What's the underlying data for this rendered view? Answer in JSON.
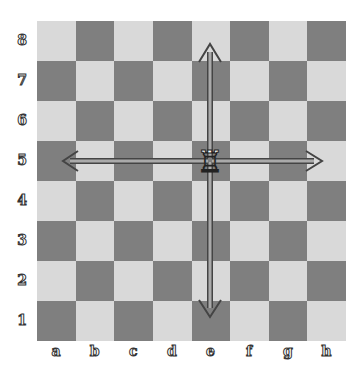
{
  "board": {
    "files": [
      "a",
      "b",
      "c",
      "d",
      "e",
      "f",
      "g",
      "h"
    ],
    "ranks": [
      "8",
      "7",
      "6",
      "5",
      "4",
      "3",
      "2",
      "1"
    ],
    "colors": {
      "light": "#d9d9d9",
      "dark": "#7f7f7f",
      "arrow": "#999999",
      "arrow_outline": "#444444"
    },
    "pieces": [
      {
        "square": "e5",
        "piece": "white-rook",
        "glyph": "♖"
      }
    ],
    "arrows": [
      {
        "from": "e5",
        "to": "e8",
        "direction": "up"
      },
      {
        "from": "e5",
        "to": "e1",
        "direction": "down"
      },
      {
        "from": "e5",
        "to": "a5",
        "direction": "left"
      },
      {
        "from": "e5",
        "to": "h5",
        "direction": "right"
      }
    ]
  }
}
